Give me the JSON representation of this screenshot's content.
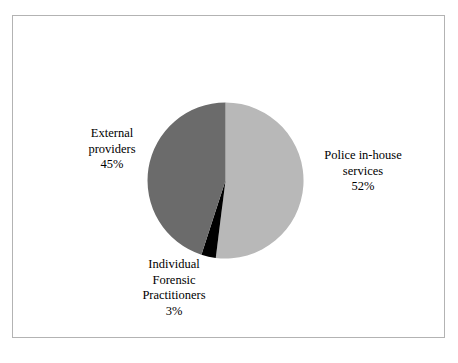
{
  "figure": {
    "frame_border_color": "#b3b3b3",
    "background_color": "#ffffff"
  },
  "chart_data": {
    "type": "pie",
    "title": "",
    "subtitle": "",
    "xlabel": "",
    "ylabel": "",
    "legend_position": "none",
    "grid": false,
    "start_angle_deg": 0,
    "direction": "clockwise",
    "units": "percent",
    "categories": [
      "Police in-house services",
      "Individual Forensic Practitioners",
      "External providers"
    ],
    "values": [
      52,
      3,
      45
    ],
    "colors": [
      "#b8b8b8",
      "#000000",
      "#6b6b6b"
    ],
    "slices": [
      {
        "label": "Police in-house services",
        "value": 52,
        "value_text": "52%",
        "color": "#b8b8b8",
        "label_lines": [
          "Police in-house",
          "services",
          "52%"
        ],
        "label_position": "right"
      },
      {
        "label": "Individual Forensic Practitioners",
        "value": 3,
        "value_text": "3%",
        "color": "#000000",
        "label_lines": [
          "Individual",
          "Forensic",
          "Practitioners",
          "3%"
        ],
        "label_position": "bottom"
      },
      {
        "label": "External providers",
        "value": 45,
        "value_text": "45%",
        "color": "#6b6b6b",
        "label_lines": [
          "External",
          "providers",
          "45%"
        ],
        "label_position": "left"
      }
    ]
  },
  "labels": {
    "external": {
      "line1": "External",
      "line2": "providers",
      "line3": "45%"
    },
    "police": {
      "line1": "Police in-house",
      "line2": "services",
      "line3": "52%"
    },
    "ifp": {
      "line1": "Individual",
      "line2": "Forensic",
      "line3": "Practitioners",
      "line4": "3%"
    }
  }
}
